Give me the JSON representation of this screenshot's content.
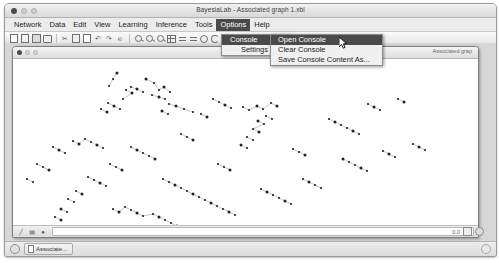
{
  "window": {
    "title": "BayesiaLab - Associated graph 1.xbl",
    "traffic_lights": [
      "close",
      "minimize",
      "maximize"
    ]
  },
  "menubar": {
    "items": [
      {
        "label": "Network",
        "active": false
      },
      {
        "label": "Data",
        "active": false
      },
      {
        "label": "Edit",
        "active": false
      },
      {
        "label": "View",
        "active": false
      },
      {
        "label": "Learning",
        "active": false
      },
      {
        "label": "Inference",
        "active": false
      },
      {
        "label": "Tools",
        "active": false
      },
      {
        "label": "Options",
        "active": true
      },
      {
        "label": "Help",
        "active": false
      }
    ]
  },
  "toolbar": {
    "icons": [
      "new-document-icon",
      "open-document-icon",
      "save-icon",
      "print-icon",
      "cut-icon",
      "copy-icon",
      "paste-icon",
      "undo-icon",
      "redo-icon",
      "find-icon",
      "zoom-in-icon",
      "zoom-out-icon",
      "zoom-fit-icon",
      "grid-layout-icon",
      "align-horizontal-icon",
      "distribute-icon",
      "circle-layout-icon",
      "arc-layout-icon",
      "node-icon",
      "globe-icon",
      "page-icon"
    ]
  },
  "options_menu": {
    "items": [
      {
        "label": "Console",
        "has_submenu": true,
        "selected": true,
        "arrow": "▶"
      },
      {
        "label": "Settings",
        "has_submenu": false,
        "selected": false,
        "arrow": ""
      }
    ]
  },
  "console_submenu": {
    "items": [
      {
        "label": "Open Console",
        "selected": true
      },
      {
        "label": "Clear Console",
        "selected": false
      },
      {
        "label": "Save Console Content As...",
        "selected": false
      }
    ]
  },
  "document_window": {
    "title": "Associated grap",
    "traffic_lights": [
      "close",
      "minimize",
      "maximize"
    ],
    "status": {
      "tool_icon": "edge-tool-icon",
      "layout_icon": "layout-tool-icon",
      "node-icon": "node-marker-icon",
      "field_value": ""
    }
  },
  "status_bar": {
    "zoom_value": "0.0",
    "icons": [
      "page-fit-icon",
      "globe-status-icon"
    ]
  },
  "taskbar": {
    "app_icon": "bayesialab-icon",
    "tab_label": "Associate...",
    "right_icon": "help-icon"
  },
  "cursor": {
    "type": "arrow-pointer",
    "x": 334,
    "y": 33
  },
  "graph": {
    "description": "Bayesian network scatter of small node markers with connecting edges",
    "nodes": [
      [
        104,
        14
      ],
      [
        100,
        20
      ],
      [
        96,
        27
      ],
      [
        133,
        20
      ],
      [
        141,
        24
      ],
      [
        146,
        31
      ],
      [
        151,
        28
      ],
      [
        157,
        33
      ],
      [
        139,
        36
      ],
      [
        146,
        38
      ],
      [
        152,
        40
      ],
      [
        118,
        28
      ],
      [
        124,
        30
      ],
      [
        130,
        33
      ],
      [
        113,
        31
      ],
      [
        119,
        34
      ],
      [
        110,
        40
      ],
      [
        156,
        45
      ],
      [
        163,
        47
      ],
      [
        171,
        50
      ],
      [
        180,
        53
      ],
      [
        149,
        52
      ],
      [
        155,
        55
      ],
      [
        95,
        44
      ],
      [
        101,
        47
      ],
      [
        107,
        50
      ],
      [
        88,
        50
      ],
      [
        94,
        53
      ],
      [
        200,
        40
      ],
      [
        206,
        43
      ],
      [
        212,
        46
      ],
      [
        218,
        49
      ],
      [
        188,
        55
      ],
      [
        194,
        58
      ],
      [
        230,
        48
      ],
      [
        236,
        51
      ],
      [
        244,
        47
      ],
      [
        250,
        50
      ],
      [
        258,
        44
      ],
      [
        264,
        47
      ],
      [
        253,
        57
      ],
      [
        259,
        60
      ],
      [
        245,
        62
      ],
      [
        251,
        65
      ],
      [
        240,
        70
      ],
      [
        246,
        73
      ],
      [
        234,
        78
      ],
      [
        240,
        81
      ],
      [
        228,
        86
      ],
      [
        234,
        89
      ],
      [
        60,
        82
      ],
      [
        66,
        85
      ],
      [
        72,
        80
      ],
      [
        78,
        83
      ],
      [
        84,
        86
      ],
      [
        90,
        89
      ],
      [
        40,
        88
      ],
      [
        46,
        91
      ],
      [
        52,
        94
      ],
      [
        118,
        88
      ],
      [
        124,
        91
      ],
      [
        130,
        94
      ],
      [
        136,
        97
      ],
      [
        142,
        100
      ],
      [
        97,
        105
      ],
      [
        103,
        108
      ],
      [
        109,
        111
      ],
      [
        75,
        118
      ],
      [
        81,
        121
      ],
      [
        87,
        124
      ],
      [
        93,
        127
      ],
      [
        63,
        132
      ],
      [
        69,
        135
      ],
      [
        55,
        140
      ],
      [
        61,
        143
      ],
      [
        48,
        150
      ],
      [
        54,
        153
      ],
      [
        42,
        158
      ],
      [
        48,
        161
      ],
      [
        150,
        120
      ],
      [
        156,
        123
      ],
      [
        162,
        126
      ],
      [
        168,
        129
      ],
      [
        174,
        132
      ],
      [
        180,
        135
      ],
      [
        186,
        138
      ],
      [
        192,
        141
      ],
      [
        198,
        144
      ],
      [
        204,
        147
      ],
      [
        210,
        150
      ],
      [
        216,
        153
      ],
      [
        222,
        156
      ],
      [
        100,
        150
      ],
      [
        106,
        153
      ],
      [
        112,
        148
      ],
      [
        118,
        151
      ],
      [
        124,
        154
      ],
      [
        130,
        157
      ],
      [
        140,
        155
      ],
      [
        146,
        158
      ],
      [
        152,
        161
      ],
      [
        158,
        164
      ],
      [
        164,
        167
      ],
      [
        170,
        170
      ],
      [
        248,
        130
      ],
      [
        254,
        133
      ],
      [
        260,
        136
      ],
      [
        266,
        139
      ],
      [
        272,
        142
      ],
      [
        278,
        145
      ],
      [
        290,
        120
      ],
      [
        296,
        123
      ],
      [
        302,
        126
      ],
      [
        308,
        129
      ],
      [
        330,
        100
      ],
      [
        336,
        103
      ],
      [
        342,
        106
      ],
      [
        348,
        109
      ],
      [
        354,
        112
      ],
      [
        370,
        92
      ],
      [
        376,
        95
      ],
      [
        382,
        98
      ],
      [
        400,
        85
      ],
      [
        406,
        88
      ],
      [
        412,
        91
      ],
      [
        316,
        60
      ],
      [
        322,
        63
      ],
      [
        328,
        66
      ],
      [
        334,
        69
      ],
      [
        340,
        72
      ],
      [
        346,
        75
      ],
      [
        355,
        45
      ],
      [
        361,
        48
      ],
      [
        367,
        51
      ],
      [
        385,
        40
      ],
      [
        391,
        43
      ],
      [
        280,
        90
      ],
      [
        286,
        93
      ],
      [
        292,
        96
      ],
      [
        205,
        105
      ],
      [
        211,
        108
      ],
      [
        217,
        111
      ],
      [
        168,
        75
      ],
      [
        174,
        78
      ],
      [
        180,
        81
      ],
      [
        24,
        105
      ],
      [
        30,
        108
      ],
      [
        36,
        111
      ],
      [
        14,
        120
      ],
      [
        20,
        123
      ]
    ]
  }
}
